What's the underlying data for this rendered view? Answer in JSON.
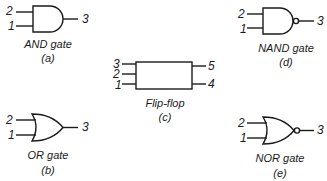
{
  "gates": {
    "and": {
      "name": "AND gate",
      "label": "(a)",
      "inputs": [
        "2",
        "1"
      ],
      "output": "3"
    },
    "or": {
      "name": "OR gate",
      "label": "(b)",
      "inputs": [
        "2",
        "1"
      ],
      "output": "3"
    },
    "flipflop": {
      "name": "Flip-flop",
      "label": "(c)",
      "inputs": [
        "3",
        "2",
        "1"
      ],
      "outputs": [
        "5",
        "4"
      ]
    },
    "nand": {
      "name": "NAND gate",
      "label": "(d)",
      "inputs": [
        "2",
        "1"
      ],
      "output": "3"
    },
    "nor": {
      "name": "NOR gate",
      "label": "(e)",
      "inputs": [
        "2",
        "1"
      ],
      "output": "3"
    }
  }
}
